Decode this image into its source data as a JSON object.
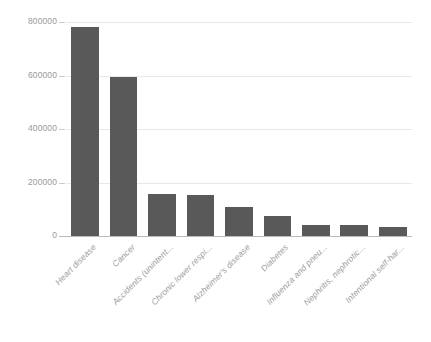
{
  "chart_data": {
    "type": "bar",
    "title": "",
    "subtitle": "",
    "xlabel": "",
    "ylabel": "",
    "categories": [
      "Heart disease",
      "Cancer",
      "Accidents (unintent...",
      "Chronic lower respi...",
      "Alzheimer's disease",
      "Diabetes",
      "Influenza and pneu...",
      "Nephritis, nephrotic...",
      "Intentional self-har..."
    ],
    "values": [
      781000,
      594000,
      157000,
      153000,
      108000,
      75000,
      41000,
      41000,
      34000
    ],
    "ylim": [
      0,
      800000
    ],
    "ytick_labels": [
      "0",
      "200000",
      "400000",
      "600000",
      "800000"
    ],
    "ytick_values": [
      0,
      200000,
      400000,
      600000,
      800000
    ],
    "grid": true,
    "legend": "none",
    "bar_color": "#595959",
    "gridline_color": "#e8e8e8",
    "axis_color": "#b9b9b9",
    "tick_label_color": "#9a9a9a",
    "background_color": "#ffffff"
  }
}
